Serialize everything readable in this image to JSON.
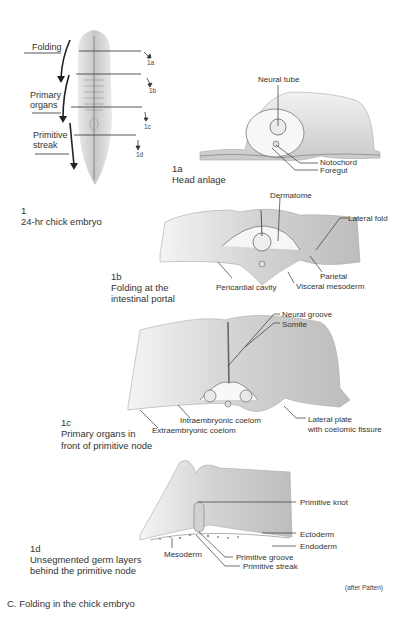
{
  "figure": {
    "caption": "C. Folding in the chick embryo",
    "credit": "(after Patten)"
  },
  "panel1": {
    "number": "1",
    "title": "24-hr chick embryo",
    "region_labels": [
      "Folding",
      "Primary organs",
      "Primitive streak"
    ],
    "region_label_lines": {
      "folding": "Folding",
      "primary_1": "Primary",
      "primary_2": "organs",
      "primitive_1": "Primitive",
      "primitive_2": "streak"
    },
    "section_refs": [
      "1a",
      "1b",
      "1c",
      "1d"
    ]
  },
  "panel1a": {
    "number": "1a",
    "title": "Head anlage",
    "labels": {
      "neural_tube": "Neural tube",
      "notochord": "Notochord",
      "foregut": "Foregut"
    }
  },
  "panel1b": {
    "number": "1b",
    "title_line1": "Folding at the",
    "title_line2": "intestinal portal",
    "labels": {
      "dermatome": "Dermatome",
      "lateral_fold": "Lateral fold",
      "parietal": "Parietal",
      "pericardial_cavity": "Pericardial cavity",
      "visceral_mesoderm": "Visceral mesoderm"
    }
  },
  "panel1c": {
    "number": "1c",
    "title_line1": "Primary organs in",
    "title_line2": "front of primitive node",
    "labels": {
      "neural_groove": "Neural groove",
      "somite": "Somite",
      "intraembryonic_coelom": "Intraembryonic coelom",
      "extraembryonic_coelom": "Extraembryonic coelom",
      "lateral_plate_1": "Lateral plate",
      "lateral_plate_2": "with coelomic fissure"
    }
  },
  "panel1d": {
    "number": "1d",
    "title_line1": "Unsegmented germ layers",
    "title_line2": "behind the primitive node",
    "labels": {
      "primitive_knot": "Primitive knot",
      "ectoderm": "Ectoderm",
      "endoderm": "Endoderm",
      "mesoderm": "Mesoderm",
      "primitive_groove": "Primitive groove",
      "primitive_streak": "Primitive streak"
    }
  }
}
